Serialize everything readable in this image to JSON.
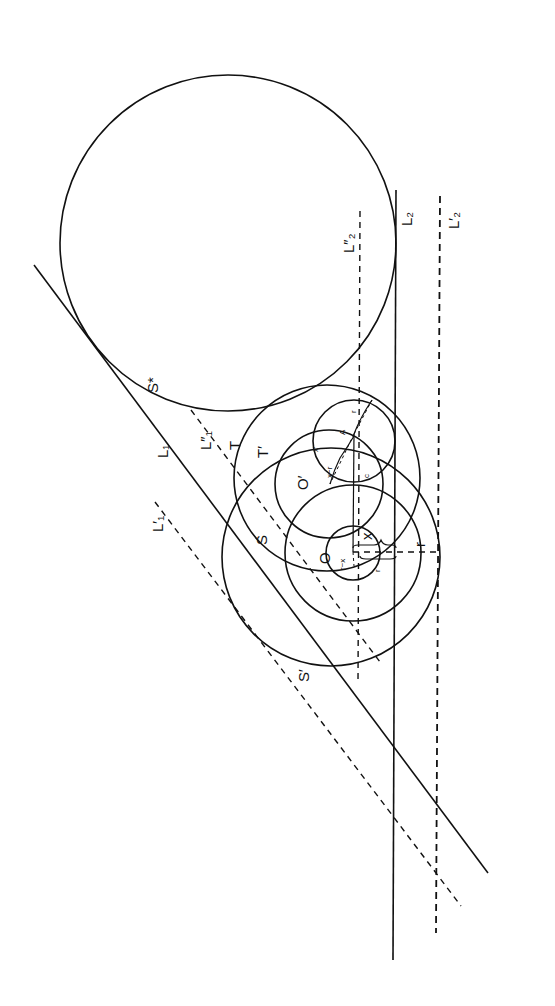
{
  "figure": {
    "rotation_deg": 90,
    "lines": [
      {
        "id": "L1",
        "label": "L",
        "sub": "1",
        "style": "solid"
      },
      {
        "id": "L1p",
        "label": "L′",
        "sub": "1",
        "style": "dashed"
      },
      {
        "id": "L1pp",
        "label": "L″",
        "sub": "1",
        "style": "dashed"
      },
      {
        "id": "L2",
        "label": "L",
        "sub": "2",
        "style": "solid"
      },
      {
        "id": "L2p",
        "label": "L′",
        "sub": "2",
        "style": "dashed"
      },
      {
        "id": "L2pp",
        "label": "L″",
        "sub": "2",
        "style": "dashed"
      }
    ],
    "circles": [
      {
        "id": "S_star",
        "label": "S*"
      },
      {
        "id": "S",
        "label": "S"
      },
      {
        "id": "S_prime",
        "label": "S′"
      },
      {
        "id": "T",
        "label": "T"
      },
      {
        "id": "T_prime",
        "label": "T′"
      },
      {
        "id": "A_circle",
        "label": ""
      },
      {
        "id": "O_circle",
        "label": ""
      }
    ],
    "points": [
      {
        "id": "O",
        "label": "O"
      },
      {
        "id": "O_prime",
        "label": "O′"
      },
      {
        "id": "A",
        "label": "A"
      },
      {
        "id": "C",
        "label": "c"
      }
    ],
    "measures": [
      {
        "id": "x",
        "label": "x"
      },
      {
        "id": "r_outer",
        "label": "r"
      },
      {
        "id": "r_inner",
        "label": "r"
      },
      {
        "id": "x_prime",
        "label": "x′"
      },
      {
        "id": "x_minus_r",
        "label": "x−r"
      },
      {
        "id": "r_small",
        "label": "r"
      },
      {
        "id": "r_minus_x",
        "label": "r−x"
      }
    ]
  },
  "labels": {
    "S_star": "S*",
    "S": "S",
    "S_prime": "S′",
    "T": "T",
    "T_prime": "T′",
    "O": "O",
    "O_prime": "O′",
    "A": "A",
    "C": "c",
    "L1": "L₁",
    "L1p": "L′₁",
    "L1pp": "L″₁",
    "L2": "L₂",
    "L2p": "L′₂",
    "L2pp": "L″₂",
    "x": "x",
    "r_outer": "r",
    "r_inner": "r",
    "x_prime": "x′",
    "x_minus_r": "x−r",
    "r_small": "r",
    "r_minus_x": "r−x"
  }
}
